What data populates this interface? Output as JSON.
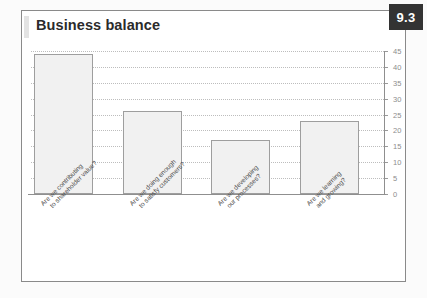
{
  "card": {
    "title": "Business balance",
    "badge": "9.3"
  },
  "chart_data": {
    "type": "bar",
    "title": "Business balance",
    "xlabel": "",
    "ylabel": "",
    "ylim": [
      0,
      45
    ],
    "grid": true,
    "legend": "none",
    "tick_labels": [
      "45",
      "40",
      "35",
      "30",
      "25",
      "20",
      "15",
      "10",
      "5",
      "0"
    ],
    "ticks": [
      45,
      40,
      35,
      30,
      25,
      20,
      15,
      10,
      5,
      0
    ],
    "y_axis_position": "right",
    "categories": [
      "Are we contributing to shareholder value?",
      "Are we doing enough to satisfy customers?",
      "Are we developing our processes?",
      "Are we learning and growing?"
    ],
    "category_lines": [
      [
        "Are we contributing",
        "to shareholder value?"
      ],
      [
        "Are we doing enough",
        "to satisfy customers?"
      ],
      [
        "Are we developing",
        "our processes?"
      ],
      [
        "Are we learning",
        "and growing?"
      ]
    ],
    "values": [
      44,
      26,
      17,
      23
    ],
    "bar_fill": "#f1f1f1",
    "bar_border": "#9e9e9e"
  }
}
